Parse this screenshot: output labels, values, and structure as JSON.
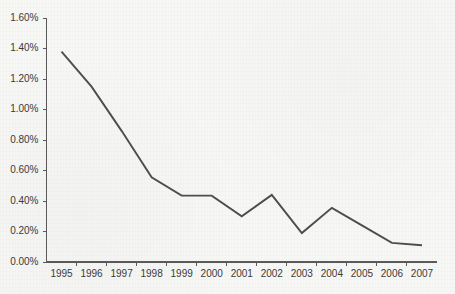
{
  "chart_data": {
    "type": "line",
    "title": "",
    "subtitle": "",
    "xlabel": "",
    "ylabel": "",
    "categories": [
      "1995",
      "1996",
      "1997",
      "1998",
      "1999",
      "2000",
      "2001",
      "2002",
      "2003",
      "2004",
      "2005",
      "2006",
      "2007"
    ],
    "values": [
      1.38,
      1.15,
      0.86,
      0.555,
      0.435,
      0.435,
      0.3,
      0.44,
      0.19,
      0.355,
      0.24,
      0.125,
      0.11
    ],
    "series": [
      {
        "name": "",
        "values": [
          1.38,
          1.15,
          0.86,
          0.555,
          0.435,
          0.435,
          0.3,
          0.44,
          0.19,
          0.355,
          0.24,
          0.125,
          0.11
        ]
      }
    ],
    "ylim": [
      0.0,
      1.6
    ],
    "ytick_values": [
      0.0,
      0.2,
      0.4,
      0.6,
      0.8,
      1.0,
      1.2,
      1.4,
      1.6
    ],
    "ytick_labels": [
      "0.00%",
      "0.20%",
      "0.40%",
      "0.60%",
      "0.80%",
      "1.00%",
      "1.20%",
      "1.40%",
      "1.60%"
    ],
    "value_suffix": "%",
    "grid": false,
    "legend": false,
    "legend_position": "none",
    "annotations": [],
    "colors": {
      "line": "#4d4d4d",
      "axis": "#5a5a5a",
      "text": "#3a3a3a",
      "background": "#f7f7f5"
    }
  }
}
